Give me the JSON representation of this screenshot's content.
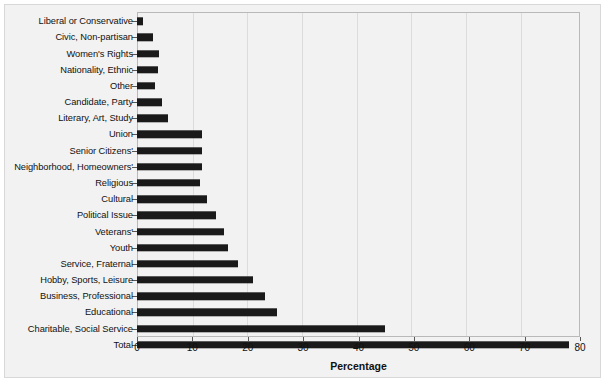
{
  "chart_data": {
    "type": "bar",
    "orientation": "horizontal",
    "title": "",
    "xlabel": "Percentage",
    "ylabel": "",
    "xlim": [
      0,
      80
    ],
    "xticks": [
      0,
      10,
      20,
      30,
      40,
      50,
      60,
      70,
      80
    ],
    "grid": true,
    "legend": "none",
    "bar_color": "#1a1a1a",
    "background_color": "#f2f2f2",
    "categories": [
      "Liberal or Conservative",
      "Civic, Non-partisan",
      "Women's Rights",
      "Nationality, Ethnic",
      "Other",
      "Candidate, Party",
      "Literary, Art, Study",
      "Union",
      "Senior Citizens'",
      "Neighborhood, Homeowners'",
      "Religious",
      "Cultural",
      "Political Issue",
      "Veterans'",
      "Youth",
      "Service, Fraternal",
      "Hobby, Sports, Leisure",
      "Business, Professional",
      "Educational",
      "Charitable, Social Service",
      "Total"
    ],
    "values": [
      1.0,
      2.8,
      3.9,
      3.8,
      3.3,
      4.6,
      5.6,
      11.8,
      11.8,
      11.8,
      11.4,
      12.7,
      14.2,
      15.7,
      16.5,
      18.2,
      20.9,
      23.1,
      25.3,
      44.7,
      78.0
    ]
  },
  "axis": {
    "tick_labels": [
      "0",
      "10",
      "20",
      "30",
      "40",
      "50",
      "60",
      "70",
      "80"
    ],
    "x_title": "Percentage"
  }
}
